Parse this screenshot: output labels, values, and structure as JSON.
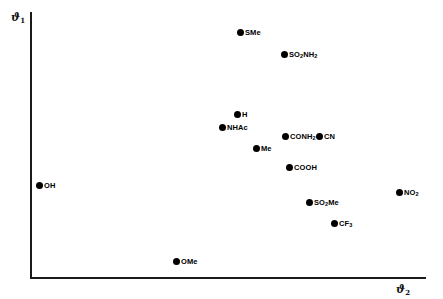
{
  "chart_data": {
    "type": "scatter",
    "title": "",
    "subtitle": "",
    "xlabel": "ϑ2",
    "ylabel": "ϑ1",
    "xlabel_base": "ϑ",
    "xlabel_sub": "2",
    "ylabel_base": "ϑ",
    "ylabel_sub": "1",
    "grid": false,
    "legend": "none",
    "xlim": [
      0,
      1
    ],
    "ylim": [
      0,
      1
    ],
    "axis_ticks": "none",
    "marker_color": "#000000",
    "axis_color": "#1a1a1a",
    "points": [
      {
        "label": "SMe",
        "label_base": "SMe",
        "label_sub": "",
        "x": 0.532,
        "y": 0.927,
        "px": 240,
        "py": 32,
        "label_side": "right"
      },
      {
        "label": "SO2NH2",
        "label_base": "SO",
        "label_sub": "2",
        "label_tail": "NH",
        "label_sub2": "2",
        "x": 0.643,
        "y": 0.844,
        "px": 284,
        "py": 54,
        "label_side": "right"
      },
      {
        "label": "H",
        "label_base": "H",
        "label_sub": "",
        "x": 0.523,
        "y": 0.616,
        "px": 237,
        "py": 114,
        "label_side": "right"
      },
      {
        "label": "NHAc",
        "label_base": "NHAc",
        "label_sub": "",
        "x": 0.485,
        "y": 0.567,
        "px": 222,
        "py": 127,
        "label_side": "right"
      },
      {
        "label": "CONH2",
        "label_base": "CONH",
        "label_sub": "2",
        "x": 0.644,
        "y": 0.533,
        "px": 285,
        "py": 136,
        "label_side": "right"
      },
      {
        "label": "CN",
        "label_base": "CN",
        "label_sub": "",
        "x": 0.73,
        "y": 0.533,
        "px": 319,
        "py": 136,
        "label_side": "right"
      },
      {
        "label": "Me",
        "label_base": "Me",
        "label_sub": "",
        "x": 0.571,
        "y": 0.488,
        "px": 256,
        "py": 148,
        "label_side": "right"
      },
      {
        "label": "COOH",
        "label_base": "COOH",
        "label_sub": "",
        "x": 0.654,
        "y": 0.417,
        "px": 289,
        "py": 167,
        "label_side": "right"
      },
      {
        "label": "OH",
        "label_base": "OH",
        "label_sub": "",
        "x": 0.023,
        "y": 0.349,
        "px": 39,
        "py": 185,
        "label_side": "right"
      },
      {
        "label": "NO2",
        "label_base": "NO",
        "label_sub": "2",
        "x": 0.932,
        "y": 0.322,
        "px": 399,
        "py": 192,
        "label_side": "right"
      },
      {
        "label": "SO2Me",
        "label_base": "SO",
        "label_sub": "2",
        "label_tail": "Me",
        "x": 0.705,
        "y": 0.285,
        "px": 309,
        "py": 202,
        "label_side": "right"
      },
      {
        "label": "CF3",
        "label_base": "CF",
        "label_sub": "3",
        "x": 0.768,
        "y": 0.206,
        "px": 334,
        "py": 223,
        "label_side": "right"
      },
      {
        "label": "OMe",
        "label_base": "OMe",
        "label_sub": "",
        "x": 0.369,
        "y": 0.064,
        "px": 176,
        "py": 261,
        "label_side": "right"
      }
    ]
  }
}
